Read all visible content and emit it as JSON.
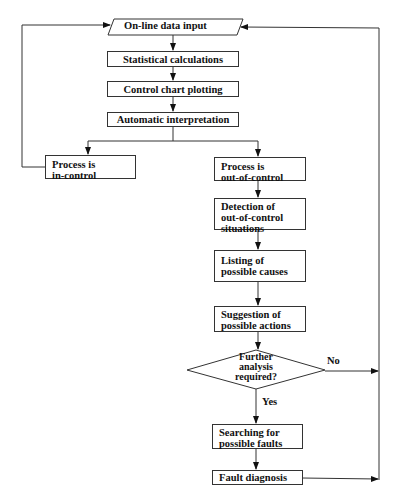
{
  "diagram": {
    "type": "flowchart",
    "nodes": {
      "input": "On-line data input",
      "stats": "Statistical calculations",
      "plot": "Control chart plotting",
      "interp": "Automatic interpretation",
      "in_control_1": "Process is",
      "in_control_2": "in-control",
      "out_control_1": "Process is",
      "out_control_2": "out-of-control",
      "detect_1": "Detection of",
      "detect_2": "out-of-control",
      "detect_3": "situations",
      "causes_1": "Listing of",
      "causes_2": "possible causes",
      "actions_1": "Suggestion of",
      "actions_2": "possible actions",
      "decision_1": "Further",
      "decision_2": "analysis",
      "decision_3": "required?",
      "search_1": "Searching for",
      "search_2": "possible faults",
      "diagnosis": "Fault diagnosis"
    },
    "edge_labels": {
      "no": "No",
      "yes": "Yes"
    },
    "edges": [
      [
        "input",
        "stats"
      ],
      [
        "stats",
        "plot"
      ],
      [
        "plot",
        "interp"
      ],
      [
        "interp",
        "in_control"
      ],
      [
        "interp",
        "out_control"
      ],
      [
        "in_control",
        "input"
      ],
      [
        "out_control",
        "detect"
      ],
      [
        "detect",
        "causes"
      ],
      [
        "causes",
        "actions"
      ],
      [
        "actions",
        "decision"
      ],
      [
        "decision",
        "search",
        "Yes"
      ],
      [
        "decision",
        "input",
        "No"
      ],
      [
        "search",
        "diagnosis"
      ],
      [
        "diagnosis",
        "input"
      ]
    ]
  }
}
